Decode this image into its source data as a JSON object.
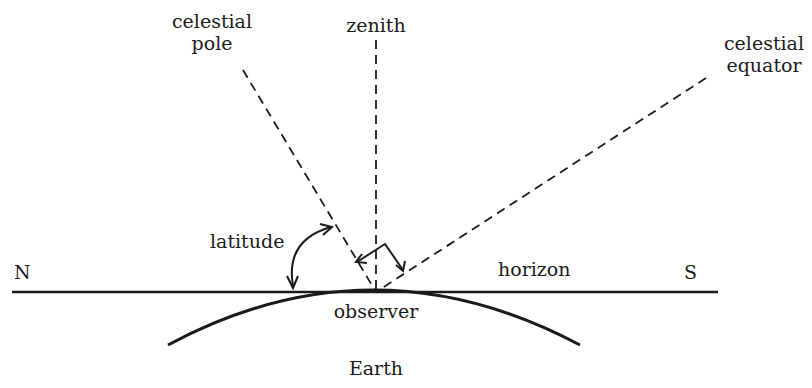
{
  "diagram": {
    "labels": {
      "celestial_pole_line1": "celestial",
      "celestial_pole_line2": "pole",
      "zenith": "zenith",
      "celestial_equator_line1": "celestial",
      "celestial_equator_line2": "equator",
      "latitude": "latitude",
      "north": "N",
      "south": "S",
      "horizon": "horizon",
      "observer": "observer",
      "earth": "Earth"
    },
    "colors": {
      "ink": "#1a1a1a",
      "background": "#ffffff"
    }
  }
}
